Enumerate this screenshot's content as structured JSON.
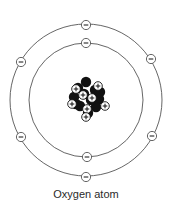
{
  "diagram": {
    "title": "Oxygen atom",
    "center": [
      86,
      100
    ],
    "colors": {
      "line": "#555555",
      "ink": "#111111",
      "background": "#ffffff"
    },
    "orbits": [
      {
        "name": "inner-shell",
        "radius": 57,
        "electrons": [
          {
            "x": 86,
            "y": 43
          },
          {
            "x": 87,
            "y": 157
          }
        ]
      },
      {
        "name": "outer-shell",
        "radius": 76,
        "electrons": [
          {
            "x": 86,
            "y": 25
          },
          {
            "x": 21,
            "y": 62
          },
          {
            "x": 151,
            "y": 59
          },
          {
            "x": 21,
            "y": 137
          },
          {
            "x": 152,
            "y": 136
          },
          {
            "x": 86,
            "y": 177
          }
        ]
      }
    ],
    "electron_symbol": "−",
    "proton_symbol": "+",
    "nucleus": {
      "protons": 8,
      "neutrons": 8,
      "neutron_positions": [
        [
          86,
          82
        ],
        [
          78,
          88
        ],
        [
          95,
          90
        ],
        [
          74,
          97
        ],
        [
          99,
          99
        ],
        [
          80,
          106
        ],
        [
          96,
          107
        ],
        [
          88,
          113
        ],
        [
          84,
          94
        ],
        [
          91,
          100
        ],
        [
          76,
          104
        ],
        [
          100,
          92
        ]
      ],
      "proton_positions": [
        [
          76,
          89
        ],
        [
          98,
          86
        ],
        [
          83,
          95
        ],
        [
          92,
          98
        ],
        [
          72,
          104
        ],
        [
          105,
          106
        ],
        [
          87,
          109
        ],
        [
          86,
          117
        ]
      ]
    }
  }
}
